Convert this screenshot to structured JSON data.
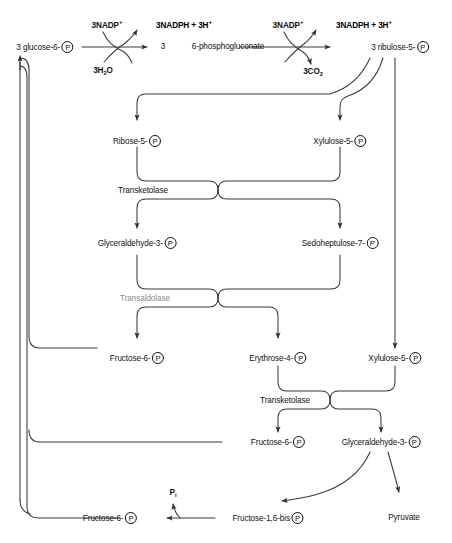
{
  "diagram": {
    "colors": {
      "line": "#3a3a3a",
      "text": "#111111",
      "muted_text": "#8a8a8a",
      "background": "#ffffff"
    }
  },
  "metabolites": {
    "glucose6p": {
      "name": "3 glucose-6-",
      "phosphate": "P"
    },
    "phosphogluconate_count": "3",
    "phosphogluconate": "6-phosphogluconate",
    "ribulose5p": {
      "name": "3 ribulose-5-",
      "phosphate": "P"
    },
    "ribose5p": {
      "name": "Ribose-5-",
      "phosphate": "P"
    },
    "xylulose5p_top": {
      "name": "Xylulose-5-",
      "phosphate": "P"
    },
    "glyceraldehyde3p_mid": {
      "name": "Glyceraldehyde-3-",
      "phosphate": "P"
    },
    "sedoheptulose7p": {
      "name": "Sedoheptulose-7-",
      "phosphate": "P"
    },
    "fructose6p_upper": {
      "name": "Fructose-6-",
      "phosphate": "P"
    },
    "erythrose4p": {
      "name": "Erythrose-4-",
      "phosphate": "P"
    },
    "xylulose5p_lower": {
      "name": "Xylulose-5-",
      "phosphate": "P"
    },
    "fructose6p_mid": {
      "name": "Fructose-6-",
      "phosphate": "P"
    },
    "glyceraldehyde3p_low": {
      "name": "Glyceraldehyde-3-",
      "phosphate": "P"
    },
    "fructose6p_bottom": {
      "name": "Fructose-6-",
      "phosphate": "P"
    },
    "fructose16bis": {
      "name": "Fructose-1,6-bis ",
      "phosphate": "P"
    },
    "pyruvate": "Pyruvate"
  },
  "cofactors": {
    "nadp_left": "3NADP",
    "nadp_left_charge": "+",
    "nadph_left": "3NADPH",
    "nadph_left_rest": " + 3H",
    "nadph_left_charge": "+",
    "water_left": "3H",
    "water_left_sub": "2",
    "water_left_rest": "O",
    "nadp_right": "3NADP",
    "nadp_right_charge": "+",
    "nadph_right": "3NADPH",
    "nadph_right_rest": " + 3H",
    "nadph_right_charge": "+",
    "co2": "3CO",
    "co2_sub": "2",
    "phosphate_i": "P",
    "phosphate_i_sub": "i"
  },
  "enzymes": {
    "transketolase_1": "Transketolase",
    "transaldolase": "Transaldolase",
    "transketolase_2": "Transketolase"
  }
}
